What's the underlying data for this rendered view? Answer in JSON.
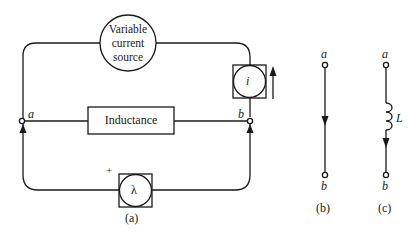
{
  "figure": {
    "panel_a": {
      "caption": "(a)",
      "source_label_lines": [
        "Variable",
        "current",
        "source"
      ],
      "inductance_label": "Inductance",
      "current_meter_symbol": "i",
      "flux_meter_symbol": "λ",
      "flux_meter_polarity": "+",
      "node_a": "a",
      "node_b": "b"
    },
    "panel_b": {
      "caption": "(b)",
      "node_top": "a",
      "node_bottom": "b"
    },
    "panel_c": {
      "caption": "(c)",
      "node_top": "a",
      "node_bottom": "b",
      "inductor_label": "L"
    },
    "colors": {
      "stroke": "#1a1a1a",
      "background": "#ffffff"
    }
  }
}
